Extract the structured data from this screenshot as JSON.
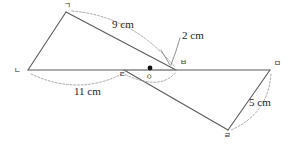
{
  "figure": {
    "type": "geometry-diagram",
    "stroke_color": "#5b5b5b",
    "dash_color": "#9a9a9a",
    "dot_color": "#111111",
    "background": "#ffffff"
  },
  "vertices": [
    {
      "id": "g",
      "label": "ㄱ",
      "x": 66,
      "y": 12,
      "label_dx": -2,
      "label_dy": -10
    },
    {
      "id": "n",
      "label": "ㄴ",
      "x": 28,
      "y": 70,
      "label_dx": -10,
      "label_dy": 1
    },
    {
      "id": "d",
      "label": "ㄷ",
      "x": 124,
      "y": 70,
      "label_dx": -2,
      "label_dy": 3
    },
    {
      "id": "r",
      "label": "ㄹ",
      "x": 228,
      "y": 130,
      "label_dx": -3,
      "label_dy": 3
    },
    {
      "id": "m",
      "label": "ㅁ",
      "x": 270,
      "y": 70,
      "label_dx": 4,
      "label_dy": -9
    },
    {
      "id": "b",
      "label": "ㅂ",
      "x": 176,
      "y": 70,
      "label_dx": 4,
      "label_dy": -10
    },
    {
      "id": "o",
      "label": "ㅇ",
      "x": 150,
      "y": 68,
      "label_dx": -3,
      "label_dy": 5
    }
  ],
  "measurements": [
    {
      "id": "len-9",
      "text": "9 cm",
      "x": 112,
      "y": 19,
      "relates": "ㄱ–ㅂ"
    },
    {
      "id": "len-2",
      "text": "2 cm",
      "x": 182,
      "y": 30,
      "relates": "ㅇ–ㅂ"
    },
    {
      "id": "len-11",
      "text": "11 cm",
      "x": 74,
      "y": 86,
      "relates": "ㄴ–ㄷ"
    },
    {
      "id": "len-5",
      "text": "5 cm",
      "x": 249,
      "y": 97,
      "relates": "ㄹ–ㅁ"
    }
  ],
  "center_point": {
    "name": "midpoint-dot",
    "x": 150,
    "y": 68,
    "radius": 2.4
  }
}
